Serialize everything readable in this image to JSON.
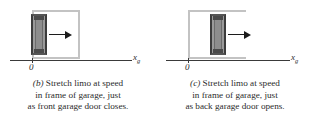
{
  "figure": {
    "panels": [
      {
        "id": "b",
        "label": "(b)",
        "axis": {
          "origin": "0",
          "label_main": "x",
          "label_sub": "g"
        },
        "caption_lines": [
          "Stretch limo at speed",
          "in frame of garage, just",
          "as front garage door closes."
        ],
        "caption_text": "(b) Stretch limo at speed in frame of garage, just as front garage door closes.",
        "scene": {
          "garage_state": "front door closing",
          "limo_position": "inside garage, at left wall",
          "motion_direction": "right"
        }
      },
      {
        "id": "c",
        "label": "(c)",
        "axis": {
          "origin": "0",
          "label_main": "x",
          "label_sub": "g"
        },
        "caption_lines": [
          "Stretch limo at speed",
          "in frame of garage, just",
          "as back garage door opens."
        ],
        "caption_text": "(c) Stretch limo at speed in frame of garage, just as back garage door opens.",
        "scene": {
          "garage_state": "back door opening",
          "limo_position": "inside garage, at right side",
          "motion_direction": "right"
        }
      }
    ],
    "colors": {
      "garage_stroke": "#c3c3c3",
      "limo_body": "#9a9a9a",
      "limo_edge": "#3c3c3c",
      "arrow": "#1c1c1c",
      "axis": "#3a3a3a",
      "text": "#2b2b2b",
      "background": "#ffffff"
    }
  }
}
